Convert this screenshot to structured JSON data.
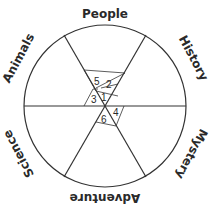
{
  "diagram": {
    "type": "genre-wheel",
    "sectors": [
      {
        "label": "People",
        "position": "top"
      },
      {
        "label": "History",
        "position": "upper-right"
      },
      {
        "label": "Mystery",
        "position": "lower-right"
      },
      {
        "label": "Adventure",
        "position": "bottom"
      },
      {
        "label": "Science",
        "position": "lower-left"
      },
      {
        "label": "Animals",
        "position": "upper-left"
      }
    ],
    "center_numbers": [
      "1",
      "2",
      "3",
      "4",
      "5",
      "6"
    ]
  }
}
